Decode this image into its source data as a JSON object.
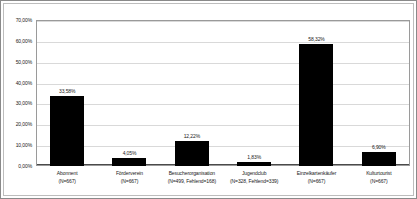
{
  "chart_data": {
    "type": "bar",
    "title": "",
    "subtitle": "",
    "xlabel": "",
    "ylabel": "",
    "ylim": [
      0,
      70
    ],
    "grid": true,
    "legend": "none",
    "orientation": "vertical",
    "bar_color": "#000000",
    "gridline_color": "#d9d9d9",
    "border_color": "#9a9a9a",
    "categories": [
      "Abonnent",
      "Förderverein",
      "Besucherorganisation",
      "Jugendclub",
      "Einzelkartenkäufer",
      "Kulturtourist"
    ],
    "category_sublabels": [
      "(N=667)",
      "(N=667)",
      "(N=499, Fehlend=168)",
      "(N=328, Fehlend=339)",
      "(N=667)",
      "(N=667)"
    ],
    "values": [
      33.58,
      4.05,
      12.22,
      1.83,
      58.32,
      6.9
    ],
    "value_labels": [
      "33,58%",
      "4,05%",
      "12,22%",
      "1,83%",
      "58,32%",
      "6,90%"
    ],
    "ytick_values": [
      0,
      10,
      20,
      30,
      40,
      50,
      60,
      70
    ],
    "ytick_labels": [
      "0,00%",
      "10,00%",
      "20,00%",
      "30,00%",
      "40,00%",
      "50,00%",
      "60,00%",
      "70,00%"
    ]
  }
}
